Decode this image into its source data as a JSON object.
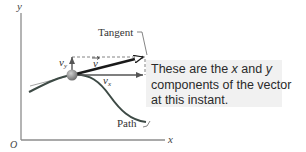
{
  "diagram": {
    "axes": {
      "x_label": "x",
      "y_label": "y",
      "origin_label": "O"
    },
    "labels": {
      "tangent": "Tangent",
      "path": "Path",
      "vector": "v",
      "vx": "v",
      "vx_sub": "x",
      "vy": "v",
      "vy_sub": "y"
    },
    "callout": {
      "line1_a": "These are the ",
      "line1_x": "x",
      "line1_b": " and ",
      "line1_y": "y",
      "line2": "components of the vector",
      "line3": "at this instant."
    },
    "colors": {
      "axis": "#8c8c8c",
      "path": "#3d4a45",
      "vector": "#1a1a1a",
      "component": "#555555",
      "particle": "#8a8a8a",
      "callout_bg": "#f1f1f1"
    }
  }
}
